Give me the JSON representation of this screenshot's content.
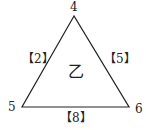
{
  "diagram": {
    "shape": "triangle",
    "vertices": {
      "top": "4",
      "bottom_left": "5",
      "bottom_right": "6"
    },
    "edges": {
      "left": "【2】",
      "right": "【5】",
      "bottom": "【8】"
    },
    "center_label": "乙",
    "stroke_color": "#222222"
  }
}
